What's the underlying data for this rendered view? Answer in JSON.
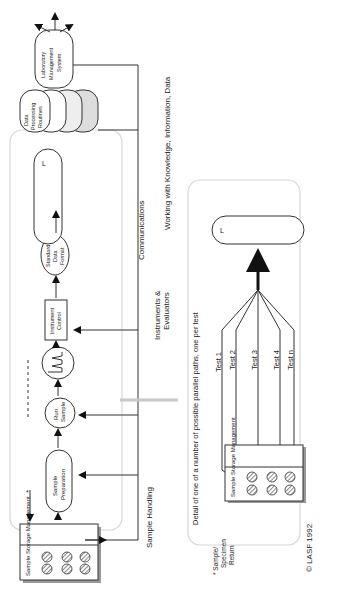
{
  "diagram": {
    "orientation": "rotated-90-clockwise",
    "upper_panel": {
      "nodes": {
        "sample_storage": "Sample Storage Management",
        "sample_preparation": [
          "Sample",
          "Preparation"
        ],
        "run_sample": [
          "Run",
          "Sample"
        ],
        "chromatogram_icon": "signal-peaks",
        "instrument_control": [
          "Instrument",
          "Control"
        ],
        "standard_data_format": [
          "Standard",
          "Data",
          "Format"
        ],
        "librarian": [
          "L",
          "i",
          "b",
          "r",
          "a",
          "r",
          "i",
          "a",
          "n"
        ],
        "data_processing_routines": [
          "Data",
          "Processing",
          "Routines"
        ],
        "lims": [
          "Laboratory",
          "Management",
          "System"
        ]
      },
      "footnote_marker": "*"
    },
    "section_labels": {
      "sample_handling": "Sample Handling",
      "instruments_evaluators": [
        "Instruments &",
        "Evaluators"
      ],
      "communications": "Communications",
      "working_with": "Working with Knowledge, Information, Data"
    },
    "lower_panel": {
      "caption": "Detail of one of a number of possible parallel paths, one per test",
      "sample_storage": "Sample Storage Management",
      "tests": [
        "Test 1",
        "Test 2",
        "Test 3",
        "Test 4",
        "Test n"
      ],
      "librarian": [
        "L",
        "i",
        "b",
        "r",
        "a",
        "r",
        "i",
        "a",
        "n"
      ]
    },
    "footnote": [
      "* Sample/",
      "Specimen",
      "Return"
    ],
    "copyright": "© LASF 1992"
  },
  "colors": {
    "line": "#333333",
    "panel_border": "#d8d8d8",
    "shade": "#dddddd",
    "gray_arrow": "#c8c8c8"
  }
}
